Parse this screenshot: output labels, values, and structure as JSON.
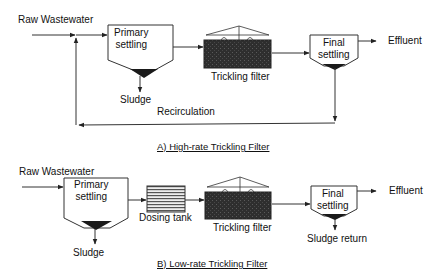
{
  "diagram_a": {
    "title": "A) High-rate Trickling Filter",
    "input_label": "Raw Wastewater",
    "primary_settling": {
      "line1": "Primary",
      "line2": "settling"
    },
    "sludge_label": "Sludge",
    "trickling_filter_label": "Trickling filter",
    "final_settling": {
      "line1": "Final",
      "line2": "settling"
    },
    "output_label": "Effluent",
    "recirculation_label": "Recirculation"
  },
  "diagram_b": {
    "title": "B) Low-rate Trickling Filter",
    "input_label": "Raw Wastewater",
    "primary_settling": {
      "line1": "Primary",
      "line2": "settling"
    },
    "sludge_label": "Sludge",
    "dosing_tank_label": "Dosing tank",
    "trickling_filter_label": "Trickling filter",
    "final_settling": {
      "line1": "Final",
      "line2": "settling"
    },
    "output_label": "Effluent",
    "sludge_return_label": "Sludge return"
  },
  "colors": {
    "line": "#333333",
    "filter_media": "#2b2b2b",
    "hopper": "#1a1a1a",
    "dosing_tank_stripes": "#555555"
  }
}
